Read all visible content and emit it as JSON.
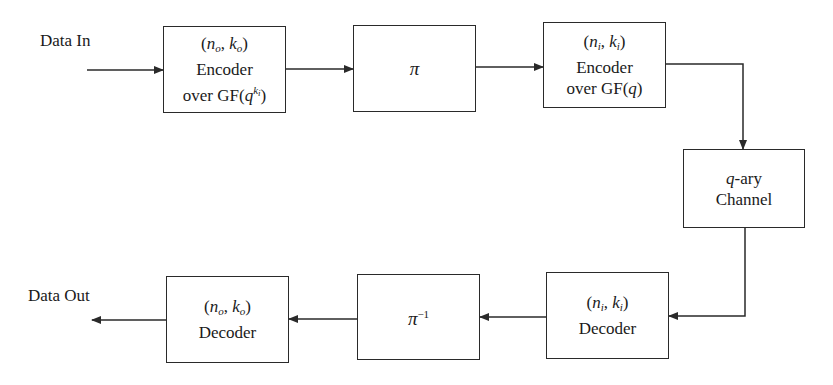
{
  "diagram": {
    "type": "block-diagram",
    "topic": "Concatenated coding system with interleaver",
    "labels": {
      "input": "Data In",
      "output": "Data Out"
    },
    "blocks": [
      {
        "id": "outer-encoder",
        "line1_n": "n",
        "line1_n_sub": "o",
        "line1_k": "k",
        "line1_k_sub": "o",
        "line2": "Encoder",
        "line3_prefix": "over GF(",
        "line3_base": "q",
        "line3_sup_base": "k",
        "line3_sup_sub": "i",
        "line3_suffix": ")"
      },
      {
        "id": "interleaver",
        "symbol": "π"
      },
      {
        "id": "inner-encoder",
        "line1_n": "n",
        "line1_n_sub": "i",
        "line1_k": "k",
        "line1_k_sub": "i",
        "line2": "Encoder",
        "line3_prefix": "over GF(",
        "line3_base": "q",
        "line3_suffix": ")"
      },
      {
        "id": "channel",
        "line1_q": "q",
        "line1_rest": "-ary",
        "line2": "Channel"
      },
      {
        "id": "inner-decoder",
        "line1_n": "n",
        "line1_n_sub": "i",
        "line1_k": "k",
        "line1_k_sub": "i",
        "line2": "Decoder"
      },
      {
        "id": "deinterleaver",
        "symbol": "π",
        "symbol_sup": "−1"
      },
      {
        "id": "outer-decoder",
        "line1_n": "n",
        "line1_n_sub": "o",
        "line1_k": "k",
        "line1_k_sub": "o",
        "line2": "Decoder"
      }
    ],
    "edges": [
      [
        "Data In",
        "outer-encoder"
      ],
      [
        "outer-encoder",
        "interleaver"
      ],
      [
        "interleaver",
        "inner-encoder"
      ],
      [
        "inner-encoder",
        "channel"
      ],
      [
        "channel",
        "inner-decoder"
      ],
      [
        "inner-decoder",
        "deinterleaver"
      ],
      [
        "deinterleaver",
        "outer-decoder"
      ],
      [
        "outer-decoder",
        "Data Out"
      ]
    ],
    "colors": {
      "stroke": "#2a2a2a",
      "background": "#ffffff",
      "text": "#1a1a1a"
    }
  }
}
